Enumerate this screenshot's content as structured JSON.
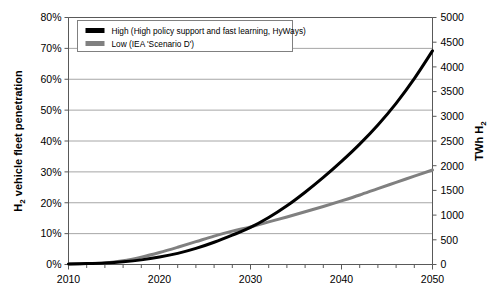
{
  "chart_data": {
    "type": "line",
    "title": "",
    "xlabel": "",
    "ylabel": "H2 vehicle fleet penetration",
    "ylabel_parts": {
      "pre": "H",
      "sub": "2",
      "post": " vehicle fleet penetration"
    },
    "y2label": "TWh H2",
    "y2label_parts": {
      "pre": "TWh H",
      "sub": "2"
    },
    "xlim": [
      2010,
      2050
    ],
    "ylim": [
      0,
      80
    ],
    "y2lim": [
      0,
      5000
    ],
    "grid": true,
    "legend_position": "top-left-inside",
    "x_tick_labels": [
      "2010",
      "2020",
      "2030",
      "2040",
      "2050"
    ],
    "x_tick_values": [
      2010,
      2020,
      2030,
      2040,
      2050
    ],
    "x_minor_tick_step": 2,
    "y_tick_labels": [
      "0%",
      "10%",
      "20%",
      "30%",
      "40%",
      "50%",
      "60%",
      "70%",
      "80%"
    ],
    "y_tick_values": [
      0,
      10,
      20,
      30,
      40,
      50,
      60,
      70,
      80
    ],
    "y2_tick_labels": [
      "0",
      "500",
      "1000",
      "1500",
      "2000",
      "2500",
      "3000",
      "3500",
      "4000",
      "4500",
      "5000"
    ],
    "y2_tick_values": [
      0,
      500,
      1000,
      1500,
      2000,
      2500,
      3000,
      3500,
      4000,
      4500,
      5000
    ],
    "x": [
      2010,
      2012,
      2014,
      2016,
      2018,
      2020,
      2022,
      2024,
      2026,
      2028,
      2030,
      2032,
      2034,
      2036,
      2038,
      2040,
      2042,
      2044,
      2046,
      2048,
      2050
    ],
    "series": [
      {
        "name": "High (High policy support and fast learning, HyWays)",
        "color": "#000000",
        "width": 3.0,
        "values": [
          0.2,
          0.3,
          0.5,
          0.9,
          1.5,
          2.4,
          3.6,
          5.2,
          7.2,
          9.5,
          12.0,
          15.2,
          19.0,
          23.4,
          28.2,
          33.4,
          39.0,
          45.2,
          52.2,
          60.2,
          69.2
        ]
      },
      {
        "name": "Low (IEA 'Scenario D')",
        "color": "#808080",
        "width": 3.0,
        "values": [
          0.2,
          0.3,
          0.5,
          1.2,
          2.4,
          3.9,
          5.6,
          7.4,
          9.2,
          10.8,
          12.2,
          13.8,
          15.4,
          17.1,
          18.8,
          20.6,
          22.5,
          24.6,
          26.6,
          28.6,
          30.6
        ]
      }
    ]
  },
  "legend": {
    "items": [
      {
        "label": "High (High policy support and fast learning, HyWays)",
        "color": "#000000"
      },
      {
        "label": "Low (IEA 'Scenario D')",
        "color": "#808080"
      }
    ]
  },
  "colors": {
    "high": "#000000",
    "low": "#808080",
    "grid": "#a6a6a6",
    "axis": "#595959",
    "background": "#ffffff"
  }
}
